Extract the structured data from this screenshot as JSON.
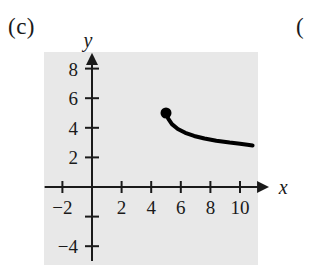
{
  "figure": {
    "part_label": "(c)",
    "next_part_label": "(",
    "panel_color": "#e8e8e8",
    "ink_color": "#1a1a1a",
    "curve_color": "#000000"
  },
  "chart_data": {
    "type": "line",
    "title": "",
    "xlabel": "x",
    "ylabel": "y",
    "xlim": [
      -3.2,
      11.8
    ],
    "ylim": [
      -5.0,
      8.9
    ],
    "grid": false,
    "legend": null,
    "x_ticks": [
      -2,
      2,
      4,
      6,
      8,
      10
    ],
    "x_tick_labels": [
      "−2",
      "2",
      "4",
      "6",
      "8",
      "10"
    ],
    "y_ticks": [
      -4,
      -2,
      2,
      4,
      6,
      8
    ],
    "y_tick_labels": [
      "−4",
      "",
      "2",
      "4",
      "6",
      "8"
    ],
    "axis_arrows": [
      "x-positive",
      "y-positive"
    ],
    "series": [
      {
        "name": "decaying branch",
        "style": "solid",
        "width": 4,
        "x": [
          5.0,
          5.15,
          5.4,
          5.8,
          6.3,
          6.9,
          7.6,
          8.4,
          9.3,
          10.0,
          10.5,
          10.85
        ],
        "y": [
          5.0,
          4.62,
          4.25,
          3.92,
          3.66,
          3.45,
          3.28,
          3.13,
          3.0,
          2.92,
          2.85,
          2.8
        ]
      }
    ],
    "points": [
      {
        "name": "closed-endpoint",
        "x": 5.0,
        "y": 5.0,
        "marker": "filled-circle",
        "size": 11
      }
    ],
    "annotations": []
  }
}
